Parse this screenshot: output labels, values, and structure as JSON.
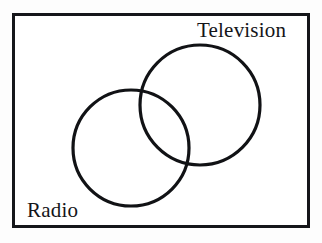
{
  "diagram": {
    "type": "venn",
    "kind": "two-set-overlapping-venn-diagram",
    "universe": {
      "name": "universal-set-rectangle",
      "border_color": "#15161a",
      "fill_color": "#ffffff"
    },
    "sets": [
      {
        "id": "television",
        "label": "Television",
        "label_position": "top-right-outside",
        "stroke_color": "#111215",
        "center_x": 200,
        "center_y": 105,
        "radius": 60
      },
      {
        "id": "radio",
        "label": "Radio",
        "label_position": "bottom-left-inside",
        "stroke_color": "#111215",
        "center_x": 131,
        "center_y": 148,
        "radius": 58
      }
    ],
    "intersection": {
      "name": "television-and-radio-overlap",
      "label": ""
    },
    "background_color": "#ffffff",
    "line_color": "#111215"
  }
}
